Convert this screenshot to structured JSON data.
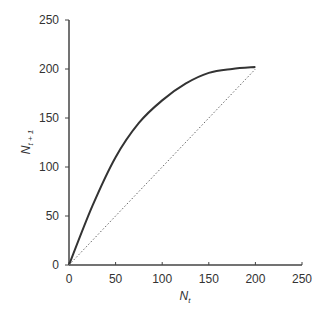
{
  "chart_data": {
    "type": "line",
    "title": "",
    "xlabel": "N_t",
    "ylabel": "N_t+1",
    "xlim": [
      0,
      250
    ],
    "ylim": [
      0,
      250
    ],
    "x_ticks": [
      0,
      50,
      100,
      150,
      200,
      250
    ],
    "y_ticks": [
      0,
      50,
      100,
      150,
      200,
      250
    ],
    "grid": false,
    "legend": null,
    "series": [
      {
        "name": "recruitment curve",
        "style": "solid",
        "x": [
          0,
          25,
          50,
          75,
          100,
          125,
          150,
          175,
          200
        ],
        "y": [
          0,
          60,
          110,
          145,
          168,
          185,
          196,
          200,
          202
        ]
      },
      {
        "name": "replacement line (N_t+1 = N_t)",
        "style": "dotted",
        "x": [
          0,
          200
        ],
        "y": [
          0,
          200
        ]
      }
    ]
  }
}
